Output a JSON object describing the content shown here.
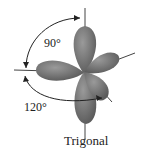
{
  "diagram": {
    "angle_top": "90°",
    "angle_bottom": "120°",
    "title": "Trigonal",
    "colors": {
      "lobe": "#6e6e6e",
      "line": "#333333",
      "background": "#ffffff"
    }
  }
}
